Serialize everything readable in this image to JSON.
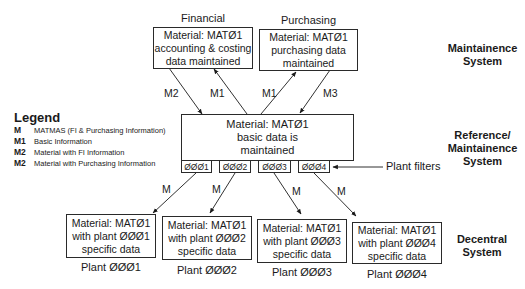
{
  "diagram": {
    "top_boxes": [
      {
        "caption": "Financial",
        "lines": [
          "Material: MATØ1",
          "accounting & costing",
          "data maintained"
        ]
      },
      {
        "caption": "Purchasing",
        "lines": [
          "Material: MATØ1",
          "purchasing data",
          "maintained"
        ]
      }
    ],
    "center_box": {
      "lines": [
        "Material: MATØ1",
        "basic data is",
        "maintained"
      ]
    },
    "plant_filters": [
      "ØØØ1",
      "ØØØ2",
      "ØØØ3",
      "ØØØ4"
    ],
    "plant_filters_label": "Plant filters",
    "plant_boxes": [
      {
        "lines": [
          "Material: MATØ1",
          "with plant ØØØ1",
          "specific data"
        ],
        "caption": "Plant ØØØ1"
      },
      {
        "lines": [
          "Material: MATØ1",
          "with plant ØØØ2",
          "specific data"
        ],
        "caption": "Plant ØØØ2"
      },
      {
        "lines": [
          "Material: MATØ1",
          "with plant ØØØ3",
          "specific data"
        ],
        "caption": "Plant ØØØ3"
      },
      {
        "lines": [
          "Material: MATØ1",
          "with plant ØØØ4",
          "specific data"
        ],
        "caption": "Plant ØØØ4"
      }
    ],
    "arrow_labels": {
      "fin_down": "M2",
      "fin_up": "M1",
      "pur_up": "M1",
      "pur_down": "M3",
      "plant1": "M",
      "plant2": "M",
      "plant3": "M",
      "plant4": "M"
    },
    "system_labels": [
      {
        "lines": [
          "Maintainence",
          "System"
        ]
      },
      {
        "lines": [
          "Reference/",
          "Maintainence",
          "System"
        ]
      },
      {
        "lines": [
          "Decentral",
          "System"
        ]
      }
    ]
  },
  "legend": {
    "title": "Legend",
    "items": [
      {
        "key": "M",
        "text": "MATMAS (FI & Purchasing Information)"
      },
      {
        "key": "M1",
        "text": "Basic Information"
      },
      {
        "key": "M2",
        "text": "Material with FI Information"
      },
      {
        "key": "M2",
        "text": "Material with Purchasing Information"
      }
    ]
  }
}
